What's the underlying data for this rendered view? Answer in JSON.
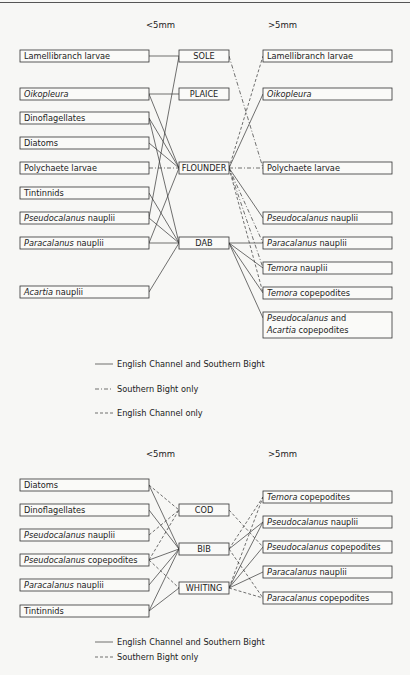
{
  "diagrams": [
    {
      "id": "flatfish",
      "headers": {
        "left": "<5mm",
        "right": ">5mm"
      },
      "header_y": 28,
      "left": [
        {
          "id": "L0",
          "y": 50,
          "h": 12,
          "parts": [
            {
              "t": "Lamellibranch  larvae"
            }
          ]
        },
        {
          "id": "L1",
          "y": 88,
          "h": 12,
          "parts": [
            {
              "t": "Oikopleura",
              "i": true
            }
          ]
        },
        {
          "id": "L2",
          "y": 112,
          "h": 12,
          "parts": [
            {
              "t": "Dinoflagellates"
            }
          ]
        },
        {
          "id": "L3",
          "y": 137,
          "h": 12,
          "parts": [
            {
              "t": "Diatoms"
            }
          ]
        },
        {
          "id": "L4",
          "y": 162,
          "h": 12,
          "parts": [
            {
              "t": "Polychaete  larvae"
            }
          ]
        },
        {
          "id": "L5",
          "y": 187,
          "h": 12,
          "parts": [
            {
              "t": "Tintinnids"
            }
          ]
        },
        {
          "id": "L6",
          "y": 212,
          "h": 12,
          "parts": [
            {
              "t": "Pseudocalanus",
              "i": true
            },
            {
              "t": "  nauplii"
            }
          ]
        },
        {
          "id": "L7",
          "y": 237,
          "h": 12,
          "parts": [
            {
              "t": "Paracalanus",
              "i": true
            },
            {
              "t": "  nauplii"
            }
          ]
        },
        {
          "id": "L8",
          "y": 286,
          "h": 12,
          "parts": [
            {
              "t": "Acartia",
              "i": true
            },
            {
              "t": " nauplii"
            }
          ]
        }
      ],
      "center": [
        {
          "id": "SOLE",
          "y": 50,
          "h": 12,
          "label": "SOLE"
        },
        {
          "id": "PLAICE",
          "y": 88,
          "h": 12,
          "label": "PLAICE"
        },
        {
          "id": "FLOUNDER",
          "y": 162,
          "h": 12,
          "label": "FLOUNDER"
        },
        {
          "id": "DAB",
          "y": 237,
          "h": 12,
          "label": "DAB"
        }
      ],
      "right": [
        {
          "id": "R0",
          "y": 50,
          "h": 12,
          "parts": [
            {
              "t": "Lamellibranch  larvae"
            }
          ]
        },
        {
          "id": "R1",
          "y": 88,
          "h": 12,
          "parts": [
            {
              "t": "Oikopleura",
              "i": true
            }
          ]
        },
        {
          "id": "R2",
          "y": 162,
          "h": 12,
          "parts": [
            {
              "t": "Polychaete  larvae"
            }
          ]
        },
        {
          "id": "R3",
          "y": 212,
          "h": 12,
          "parts": [
            {
              "t": "Pseudocalanus",
              "i": true
            },
            {
              "t": "  nauplii"
            }
          ]
        },
        {
          "id": "R4",
          "y": 237,
          "h": 12,
          "parts": [
            {
              "t": "Paracalanus",
              "i": true
            },
            {
              "t": "  nauplii"
            }
          ]
        },
        {
          "id": "R5",
          "y": 262,
          "h": 12,
          "parts": [
            {
              "t": "Temora",
              "i": true
            },
            {
              "t": "   nauplii"
            }
          ]
        },
        {
          "id": "R6",
          "y": 287,
          "h": 12,
          "parts": [
            {
              "t": "Temora",
              "i": true
            },
            {
              "t": "  copepodites"
            }
          ]
        },
        {
          "id": "R7",
          "y": 312,
          "h": 26,
          "parts": [
            {
              "t": "Pseudocalanus",
              "i": true
            },
            {
              "t": "  and"
            }
          ],
          "parts2": [
            {
              "t": "Acartia",
              "i": true
            },
            {
              "t": "  copepodites"
            }
          ]
        }
      ],
      "links": [
        {
          "from": "L0",
          "to": "SOLE",
          "style": "solid"
        },
        {
          "from": "L1",
          "to": "PLAICE",
          "style": "solid"
        },
        {
          "from": "L6",
          "to": "SOLE",
          "style": "solid"
        },
        {
          "from": "L1",
          "to": "FLOUNDER",
          "style": "solid"
        },
        {
          "from": "L2",
          "to": "FLOUNDER",
          "style": "solid"
        },
        {
          "from": "L3",
          "to": "FLOUNDER",
          "style": "solid"
        },
        {
          "from": "L4",
          "to": "FLOUNDER",
          "style": "dashdot"
        },
        {
          "from": "L7",
          "to": "FLOUNDER",
          "style": "solid"
        },
        {
          "from": "L2",
          "to": "DAB",
          "style": "solid"
        },
        {
          "from": "L5",
          "to": "DAB",
          "style": "solid"
        },
        {
          "from": "L6",
          "to": "DAB",
          "style": "solid"
        },
        {
          "from": "L7",
          "to": "DAB",
          "style": "solid"
        },
        {
          "from": "L8",
          "to": "DAB",
          "style": "solid"
        },
        {
          "from": "SOLE",
          "to": "R2",
          "style": "dashdot"
        },
        {
          "from": "FLOUNDER",
          "to": "R0",
          "style": "dash"
        },
        {
          "from": "FLOUNDER",
          "to": "R1",
          "style": "solid"
        },
        {
          "from": "FLOUNDER",
          "to": "R2",
          "style": "dashdot"
        },
        {
          "from": "FLOUNDER",
          "to": "R3",
          "style": "solid"
        },
        {
          "from": "FLOUNDER",
          "to": "R4",
          "style": "dashdot"
        },
        {
          "from": "FLOUNDER",
          "to": "R5",
          "style": "dashdot"
        },
        {
          "from": "FLOUNDER",
          "to": "R6",
          "style": "dash"
        },
        {
          "from": "DAB",
          "to": "R4",
          "style": "solid"
        },
        {
          "from": "DAB",
          "to": "R5",
          "style": "solid"
        },
        {
          "from": "DAB",
          "to": "R6",
          "style": "solid"
        },
        {
          "from": "DAB",
          "to": "R7",
          "style": "solid"
        }
      ],
      "legend": [
        {
          "style": "solid",
          "label": "English Channel and Southern Bight",
          "y": 367
        },
        {
          "style": "dashdot",
          "label": "Southern  Bight  only",
          "y": 392
        },
        {
          "style": "dash",
          "label": "English Channel  only",
          "y": 416
        }
      ]
    },
    {
      "id": "gadoids",
      "headers": {
        "left": "<5mm",
        "right": ">5mm"
      },
      "header_y": 457,
      "left": [
        {
          "id": "L0",
          "y": 479,
          "h": 12,
          "parts": [
            {
              "t": "Diatoms"
            }
          ]
        },
        {
          "id": "L1",
          "y": 504,
          "h": 12,
          "parts": [
            {
              "t": "Dinoflagellates"
            }
          ]
        },
        {
          "id": "L2",
          "y": 529,
          "h": 12,
          "parts": [
            {
              "t": "Pseudocalanus",
              "i": true
            },
            {
              "t": "  nauplii"
            }
          ]
        },
        {
          "id": "L3",
          "y": 554,
          "h": 12,
          "parts": [
            {
              "t": "Pseudocalanus",
              "i": true
            },
            {
              "t": "  copepodites"
            }
          ]
        },
        {
          "id": "L4",
          "y": 579,
          "h": 12,
          "parts": [
            {
              "t": "Paracalanus",
              "i": true
            },
            {
              "t": "  nauplii"
            }
          ]
        },
        {
          "id": "L5",
          "y": 605,
          "h": 12,
          "parts": [
            {
              "t": "Tintinnids"
            }
          ]
        }
      ],
      "center": [
        {
          "id": "COD",
          "y": 504,
          "h": 12,
          "label": "COD"
        },
        {
          "id": "BIB",
          "y": 543,
          "h": 12,
          "label": "BIB"
        },
        {
          "id": "WHITING",
          "y": 582,
          "h": 12,
          "label": "WHITING"
        }
      ],
      "right": [
        {
          "id": "R0",
          "y": 491,
          "h": 12,
          "parts": [
            {
              "t": "Temora",
              "i": true
            },
            {
              "t": "  copepodites"
            }
          ]
        },
        {
          "id": "R1",
          "y": 516,
          "h": 12,
          "parts": [
            {
              "t": "Pseudocalanus",
              "i": true
            },
            {
              "t": "  nauplii"
            }
          ]
        },
        {
          "id": "R2",
          "y": 541,
          "h": 12,
          "parts": [
            {
              "t": "Pseudocalanus",
              "i": true
            },
            {
              "t": "  copepodites"
            }
          ]
        },
        {
          "id": "R3",
          "y": 566,
          "h": 12,
          "parts": [
            {
              "t": "Paracalanus",
              "i": true
            },
            {
              "t": "  nauplii"
            }
          ]
        },
        {
          "id": "R4",
          "y": 592,
          "h": 12,
          "parts": [
            {
              "t": "Paracalanus",
              "i": true
            },
            {
              "t": "  copepodites"
            }
          ]
        }
      ],
      "links": [
        {
          "from": "L0",
          "to": "COD",
          "style": "dash"
        },
        {
          "from": "L2",
          "to": "COD",
          "style": "dash"
        },
        {
          "from": "L3",
          "to": "COD",
          "style": "dash"
        },
        {
          "from": "L0",
          "to": "BIB",
          "style": "solid"
        },
        {
          "from": "L1",
          "to": "BIB",
          "style": "solid"
        },
        {
          "from": "L3",
          "to": "BIB",
          "style": "solid"
        },
        {
          "from": "L4",
          "to": "BIB",
          "style": "solid"
        },
        {
          "from": "L5",
          "to": "BIB",
          "style": "solid"
        },
        {
          "from": "L3",
          "to": "WHITING",
          "style": "dash"
        },
        {
          "from": "L5",
          "to": "WHITING",
          "style": "solid"
        },
        {
          "from": "COD",
          "to": "R2",
          "style": "dash"
        },
        {
          "from": "BIB",
          "to": "R0",
          "style": "dash"
        },
        {
          "from": "BIB",
          "to": "R1",
          "style": "solid"
        },
        {
          "from": "BIB",
          "to": "R4",
          "style": "dash"
        },
        {
          "from": "WHITING",
          "to": "R0",
          "style": "dash"
        },
        {
          "from": "WHITING",
          "to": "R1",
          "style": "solid"
        },
        {
          "from": "WHITING",
          "to": "R2",
          "style": "solid"
        },
        {
          "from": "WHITING",
          "to": "R3",
          "style": "solid"
        },
        {
          "from": "WHITING",
          "to": "R4",
          "style": "dash"
        }
      ],
      "legend": [
        {
          "style": "solid",
          "label": "English  Channel  and  Southern  Bight",
          "y": 645
        },
        {
          "style": "dash",
          "label": "Southern  Bight  only",
          "y": 660
        }
      ]
    }
  ],
  "layout": {
    "left_x": 20,
    "left_w": 129,
    "center_x": 179,
    "center_w": 50,
    "right_x": 263,
    "right_w": 129,
    "header_left_x": 146,
    "header_right_x": 268,
    "legend_line_x1": 95,
    "legend_line_x2": 113,
    "legend_text_x": 117
  }
}
